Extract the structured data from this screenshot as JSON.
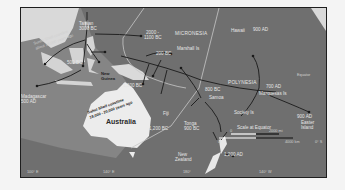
{
  "map": {
    "title": "Austronesian migration across the Pacific",
    "regions": {
      "micronesia": "MICRONESIA",
      "polynesia": "POLYNESIA",
      "australia": "Australia"
    },
    "places": {
      "taiwan": "Taiwan",
      "new_guinea_1": "New",
      "new_guinea_2": "Guinea",
      "madagascar": "Madagascar",
      "hawaii": "Hawaii",
      "marshall": "Marshall Is",
      "samoa": "Samoa",
      "tonga": "Tonga",
      "fiji": "Fiji",
      "marquesas": "Marquesas Is",
      "society": "Society Is",
      "easter_1": "Easter",
      "easter_2": "Island",
      "new_zealand_1": "New",
      "new_zealand_2": "Zealand",
      "equator": "Equator",
      "sunda": "Sunda",
      "sahul": "Sahul"
    },
    "dates": {
      "taiwan": "3000 BC",
      "micronesia_1": "2000 -",
      "micronesia_2": "1100 BC",
      "borneo": "500 BC",
      "madagascar": "500 AD",
      "marshall": "200 BC",
      "bismarck": "1,300 BC",
      "samoa": "800 BC",
      "tonga": "900 BC",
      "vanuatu": "1,200 BC",
      "hawaii": "900 AD",
      "marquesas": "700 AD",
      "easter": "900 AD",
      "new_zealand": "1,200 AD"
    },
    "annotations": {
      "sunda_shelf_1": "Sunda Shelf coastline",
      "sunda_shelf_2": "about 18,000 years ago",
      "sahul_1": "Sahul Shelf coastline",
      "sahul_2": "18,000 - 20,000 years ago"
    },
    "scale": {
      "title": "Scale at Equator",
      "zero_top": "0",
      "top_value": "2000 mi",
      "zero_bottom": "0",
      "bottom_value": "4000 km"
    },
    "graticule": {
      "lon_1": "100° E",
      "lon_2": "140° E",
      "lon_3": "180°",
      "lon_4": "140° W",
      "lat_right": "0° S"
    },
    "colors": {
      "ocean": "#6f6f6f",
      "land": "#d9d9d9",
      "shelf": "#8a8a8a",
      "route": "#1a1a1a",
      "boundary": "#c8c8c8"
    }
  }
}
